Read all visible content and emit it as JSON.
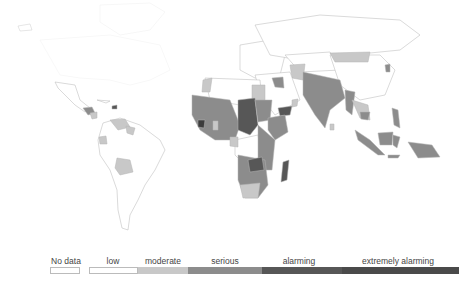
{
  "map": {
    "type": "choropleth",
    "region": "World",
    "colors": {
      "no_data": "#ffffff",
      "low": "#ffffff",
      "moderate": "#c8c8c8",
      "serious": "#8c8c8c",
      "alarming": "#575757",
      "extremely_alarming": "#3c3c3c",
      "border": "#aaaaaa"
    }
  },
  "legend": {
    "items": [
      {
        "label": "No data",
        "color": "#ffffff"
      },
      {
        "label": "low",
        "color": "#ffffff"
      },
      {
        "label": "moderate",
        "color": "#c8c8c8"
      },
      {
        "label": "serious",
        "color": "#8c8c8c"
      },
      {
        "label": "alarming",
        "color": "#575757"
      },
      {
        "label": "extremely alarming",
        "color": "#4a4a4a"
      }
    ]
  }
}
